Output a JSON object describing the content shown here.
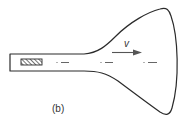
{
  "figure": {
    "caption": "(b)",
    "velocity_label": "v"
  },
  "colors": {
    "stroke": "#2b2b2b",
    "dash": "#555555",
    "background": "#ffffff"
  },
  "elements": {
    "tube": "cathode ray tube outline with narrow neck and flared bulb",
    "source": "hatched electron gun block",
    "beam_markers": 3,
    "arrow": "velocity arrow pointing right"
  }
}
